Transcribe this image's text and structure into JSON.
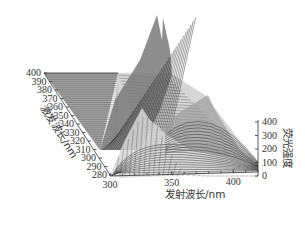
{
  "chart_data": {
    "type": "surface3d",
    "title": "",
    "x_axis": {
      "label": "发射波长/nm",
      "ticks": [
        "300",
        "350",
        "400"
      ],
      "range": [
        300,
        420
      ]
    },
    "y_axis": {
      "label": "激发波长/nm",
      "ticks": [
        "280",
        "290",
        "300",
        "310",
        "320",
        "330",
        "340",
        "350",
        "360",
        "370",
        "380",
        "390",
        "400"
      ],
      "range": [
        280,
        400
      ]
    },
    "z_axis": {
      "label": "荧光强度",
      "ticks": [
        "0",
        "100",
        "200",
        "300",
        "400"
      ],
      "range": [
        0,
        400
      ]
    },
    "features": [
      {
        "name": "Rayleigh scatter ridge (twin tall peaks)",
        "emission_nm": 320,
        "excitation_nm": 320,
        "intensity": 600
      },
      {
        "name": "Fluorescence peak A",
        "emission_nm": 330,
        "excitation_nm": 285,
        "intensity": 300
      },
      {
        "name": "Fluorescence peak B",
        "emission_nm": 370,
        "excitation_nm": 340,
        "intensity": 260
      }
    ],
    "grid": false,
    "legend": null
  },
  "labels": {
    "x_axis_label": "发射波长/nm",
    "y_axis_label": "激发波长/nm",
    "z_axis_label": "荧光强度",
    "x_ticks": [
      "300",
      "350",
      "400"
    ],
    "y_ticks": [
      "400",
      "390",
      "380",
      "370",
      "360",
      "350",
      "340",
      "330",
      "320",
      "310",
      "300",
      "290",
      "280"
    ],
    "z_ticks": [
      "400",
      "300",
      "200",
      "100",
      "0"
    ]
  }
}
